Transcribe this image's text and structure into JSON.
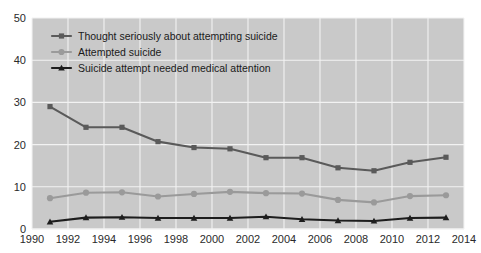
{
  "chart_data": {
    "type": "line",
    "title": "",
    "subtitle": "",
    "xlabel": "",
    "ylabel": "",
    "xlim": [
      1990,
      2014
    ],
    "ylim": [
      0,
      50
    ],
    "xticks": [
      1990,
      1992,
      1994,
      1996,
      1998,
      2000,
      2002,
      2004,
      2006,
      2008,
      2010,
      2012,
      2014
    ],
    "yticks": [
      0,
      10,
      20,
      30,
      40,
      50
    ],
    "grid": true,
    "legend_position": "top-left",
    "x": [
      1991,
      1993,
      1995,
      1997,
      1999,
      2001,
      2003,
      2005,
      2007,
      2009,
      2011,
      2013
    ],
    "series": [
      {
        "name": "Thought seriously about attempting suicide",
        "marker": "square",
        "color": "#5a5a5a",
        "values": [
          29.0,
          24.1,
          24.1,
          20.7,
          19.3,
          19.0,
          16.9,
          16.9,
          14.5,
          13.8,
          15.8,
          17.0
        ]
      },
      {
        "name": "Attempted suicide",
        "marker": "circle",
        "color": "#9a9a9a",
        "values": [
          7.3,
          8.6,
          8.7,
          7.7,
          8.3,
          8.8,
          8.5,
          8.4,
          6.9,
          6.3,
          7.8,
          8.0
        ]
      },
      {
        "name": "Suicide attempt needed medical attention",
        "marker": "triangle",
        "color": "#1d1d1d",
        "values": [
          1.7,
          2.7,
          2.8,
          2.6,
          2.6,
          2.6,
          2.9,
          2.3,
          2.0,
          1.9,
          2.6,
          2.7
        ]
      }
    ]
  },
  "axis": {
    "y_labels": [
      "50",
      "40",
      "30",
      "20",
      "10",
      "0"
    ],
    "x_labels": [
      "1990",
      "1992",
      "1994",
      "1996",
      "1998",
      "2000",
      "2002",
      "2004",
      "2006",
      "2008",
      "2010",
      "2012",
      "2014"
    ]
  },
  "legend": {
    "items": [
      {
        "label": "Thought seriously about attempting suicide"
      },
      {
        "label": "Attempted suicide"
      },
      {
        "label": "Suicide attempt needed medical attention"
      }
    ]
  },
  "style": {
    "plot_background": "#c9c9c9",
    "gridline_color": "#f2f2f2",
    "page_background": "#ffffff",
    "text_color": "#2a2a2a"
  }
}
